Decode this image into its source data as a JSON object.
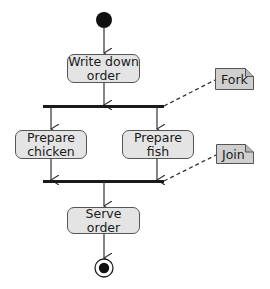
{
  "diagram": {
    "type": "UML activity diagram",
    "colors": {
      "action_fill": "#e4e4e4",
      "note_fill": "#cfcfcf",
      "stroke": "#333333",
      "bar": "#1a1a1a"
    },
    "nodes": {
      "initial": {
        "kind": "initial-node"
      },
      "write_down_order": {
        "label": "Write down\norder"
      },
      "fork": {
        "kind": "fork-bar"
      },
      "prepare_chicken": {
        "label": "Prepare\nchicken"
      },
      "prepare_fish": {
        "label": "Prepare\nfish"
      },
      "join": {
        "kind": "join-bar"
      },
      "serve_order": {
        "label": "Serve\norder"
      },
      "final": {
        "kind": "final-node"
      }
    },
    "notes": {
      "fork_note": {
        "label": "Fork",
        "annotates": "fork"
      },
      "join_note": {
        "label": "Join",
        "annotates": "join"
      }
    },
    "edges": [
      {
        "from": "initial",
        "to": "write_down_order"
      },
      {
        "from": "write_down_order",
        "to": "fork"
      },
      {
        "from": "fork",
        "to": "prepare_chicken"
      },
      {
        "from": "fork",
        "to": "prepare_fish"
      },
      {
        "from": "prepare_chicken",
        "to": "join"
      },
      {
        "from": "prepare_fish",
        "to": "join"
      },
      {
        "from": "join",
        "to": "serve_order"
      },
      {
        "from": "serve_order",
        "to": "final"
      }
    ]
  }
}
